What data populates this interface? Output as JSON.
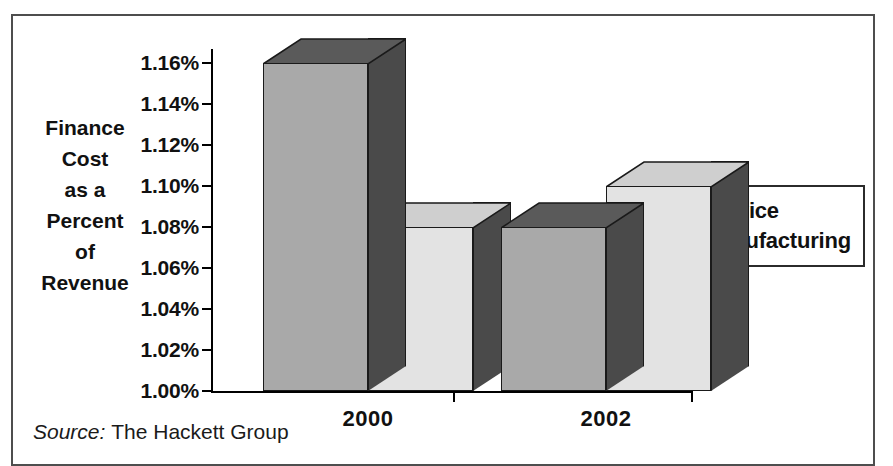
{
  "figure": {
    "title": "Finance Cost as a Percent of Revenue",
    "source_label": "Source:",
    "source_value": "The Hackett Group",
    "border_color": "#4e4e4e"
  },
  "axis_title": {
    "lines": [
      "Finance",
      "Cost",
      "as a",
      "Percent",
      "of",
      "Revenue"
    ]
  },
  "legend": {
    "position": "right",
    "entries": [
      {
        "label": "Service",
        "color": "#a9a9a9"
      },
      {
        "label": "Manufacturing",
        "color": "#e3e3e3"
      }
    ]
  },
  "chart_data": {
    "type": "bar",
    "title": "Finance Cost as a Percent of Revenue",
    "subtitle": "",
    "xlabel": "",
    "ylabel": "Finance Cost as a Percent of Revenue",
    "categories": [
      "2000",
      "2002"
    ],
    "series": [
      {
        "name": "Service",
        "color": "#a9a9a9",
        "values": [
          1.16,
          1.08
        ]
      },
      {
        "name": "Manufacturing",
        "color": "#e3e3e3",
        "values": [
          1.08,
          1.1
        ]
      }
    ],
    "ylim": [
      1.0,
      1.16
    ],
    "ytick_values": [
      1.0,
      1.02,
      1.04,
      1.06,
      1.08,
      1.1,
      1.12,
      1.14,
      1.16
    ],
    "ytick_labels": [
      "1.00%",
      "1.02%",
      "1.04%",
      "1.06%",
      "1.08%",
      "1.10%",
      "1.12%",
      "1.14%",
      "1.16%"
    ],
    "yunit": "%",
    "grid": false,
    "legend_position": "right",
    "style": "3d-column",
    "annotations": [],
    "note": "Series values by group — 2000: Service 1.16%, Manufacturing 1.08%; 2002: Service 1.06%, Manufacturing 1.10%",
    "points": [
      {
        "category": "2000",
        "series": "Service",
        "value": 1.16,
        "label": "1.16%"
      },
      {
        "category": "2000",
        "series": "Manufacturing",
        "value": 1.08,
        "label": "1.08%"
      },
      {
        "category": "2002",
        "series": "Service",
        "value": 1.06,
        "label": "1.06%"
      },
      {
        "category": "2002",
        "series": "Manufacturing",
        "value": 1.1,
        "label": "1.10%"
      }
    ]
  }
}
